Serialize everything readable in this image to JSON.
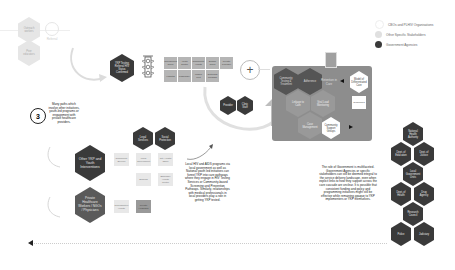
{
  "legend": {
    "items": [
      {
        "label": "CBOs and PLHIV Organisations",
        "color": "#ffffff"
      },
      {
        "label": "Other Specific Stakeholders",
        "color": "#d9d9d9"
      },
      {
        "label": "Government Agencies",
        "color": "#3a3a3a"
      }
    ]
  },
  "top_left": {
    "hex1": "Outreach workers",
    "hex2": "Peer educators",
    "small_icon_label": "Referral"
  },
  "funnel": {
    "entry_hex": "YKP Testing Referral HIV Status Confirmed",
    "grid_top": [
      "Counselling Clinic",
      "Youth Centre",
      "Community Health",
      "School Clinic",
      "Private Provider"
    ],
    "grid_bottom": [
      "Hospital",
      "Pharmacy",
      "Mobile Unit",
      "Outreach Program"
    ]
  },
  "plus_symbol": "+",
  "mid_hexes": [
    "Provider",
    "Clinic Staff"
  ],
  "cluster": {
    "hexes": [
      "Community Testing & Treatment",
      "Adherence",
      "Linkage to Care",
      "Viral Load Monitoring",
      "Case Management",
      "Retention in Care"
    ],
    "right_white_hex": "Model of Differentiated Care",
    "right_white_box": "Guidelines",
    "inner_white_hex": "Community Support Groups"
  },
  "step3": {
    "number": "3",
    "description": "Many paths which involve other initiatives, youth-led programs or engagement with private healthcare providers."
  },
  "interventions": {
    "other_hex": "Other YKP and Youth Interventions",
    "private_hex": "Private Healthcare Workers / NGOs / Physicians",
    "top_dark_hexes": [
      "Legal Services",
      "Social Protection"
    ],
    "boxes_row1": [
      "Community Service",
      "Local Government",
      "City Health Office"
    ],
    "boxes_row2": [
      "Schools",
      "Barangay Health Centre"
    ],
    "boxes_row3": [
      "Reproductive Health",
      "Private Hospitals"
    ]
  },
  "center_text": "Local HIV and AIDS programs via local government as well as National youth led initiatives can funnel YKP into care pathways where they engage in HIV Testing Services or Community-based Screening and Prevention Pathways. Similarly, relationships with medical professionals in local providers play a role in getting YKP tested.",
  "right_text": "The role of Government is multifaceted. Government Agencies or specific stakeholders can still be deemed integral to the service delivery landscape, even when explicit links to how they support across the care cascade are unclear. It is possible that consistent funding and policy and programming initiatives might still be effective while remaining opaque to YKP implementers or YKP themselves.",
  "gov_stack": [
    "National Health Authority",
    "Dept. of Education",
    "Dept. of Justice",
    "Local Government Units",
    "Dept. of Health",
    "Drug Agency",
    "Research Council",
    "Police",
    "Judiciary"
  ]
}
